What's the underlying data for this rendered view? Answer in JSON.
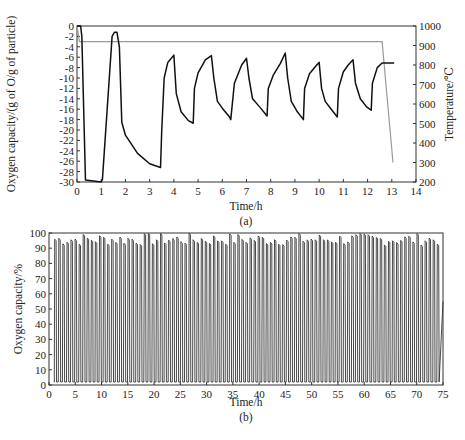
{
  "chart_data": [
    {
      "id": "a",
      "type": "line",
      "caption": "(a)",
      "xlabel": "Time/h",
      "ylabel": "Oxygen capacity/(g of O/g of particle)",
      "y2label": "Temperature/℃",
      "xlim": [
        0,
        14
      ],
      "ylim": [
        -30,
        0
      ],
      "y2lim": [
        200,
        1000
      ],
      "xticks": [
        0,
        1,
        2,
        3,
        4,
        5,
        6,
        7,
        8,
        9,
        10,
        11,
        12,
        13,
        14
      ],
      "yticks": [
        0,
        -2,
        -4,
        -6,
        -8,
        -10,
        -12,
        -14,
        -16,
        -18,
        -20,
        -22,
        -24,
        -26,
        -28,
        -30
      ],
      "y2ticks": [
        1000,
        900,
        800,
        700,
        600,
        500,
        400,
        300,
        200
      ],
      "series": [
        {
          "name": "Oxygen capacity",
          "axis": "left",
          "color": "#111111",
          "x": [
            0,
            0.15,
            0.2,
            0.35,
            1.0,
            1.05,
            1.45,
            1.55,
            1.65,
            1.75,
            1.85,
            2.0,
            2.5,
            3.0,
            3.45,
            3.5,
            3.6,
            3.75,
            4.0,
            4.1,
            4.3,
            4.6,
            4.8,
            4.85,
            5.0,
            5.3,
            5.55,
            5.65,
            5.8,
            6.0,
            6.3,
            6.35,
            6.5,
            6.8,
            7.0,
            7.1,
            7.25,
            7.55,
            7.85,
            7.9,
            8.1,
            8.4,
            8.6,
            8.7,
            8.85,
            9.1,
            9.35,
            9.4,
            9.6,
            9.9,
            10.0,
            10.1,
            10.25,
            10.5,
            10.75,
            10.8,
            11.0,
            11.2,
            11.4,
            11.5,
            11.7,
            11.95,
            12.15,
            12.2,
            12.4,
            12.6,
            12.8,
            13.1
          ],
          "y": [
            0,
            0,
            -2,
            -29.6,
            -30,
            -29.5,
            -2,
            -1.2,
            -1.2,
            -4,
            -18.5,
            -21,
            -24.5,
            -26.5,
            -27.2,
            -20,
            -10,
            -7,
            -5.6,
            -13,
            -16.5,
            -18.2,
            -18.7,
            -12,
            -9,
            -6.5,
            -5.7,
            -10,
            -14.5,
            -15.8,
            -17.5,
            -18,
            -11,
            -7.5,
            -6.2,
            -10,
            -14,
            -15.6,
            -17.3,
            -12,
            -9.5,
            -7.2,
            -5.2,
            -10,
            -14.5,
            -16.5,
            -18,
            -12,
            -9.2,
            -7.5,
            -7,
            -12,
            -14.5,
            -16,
            -17.5,
            -12,
            -8.8,
            -7.5,
            -6.5,
            -11,
            -14,
            -15.5,
            -16.2,
            -11,
            -8,
            -7.1,
            -7.1,
            -7.1
          ]
        },
        {
          "name": "Temperature",
          "axis": "right",
          "color": "#9a9a9a",
          "x": [
            0,
            0.1,
            0.2,
            12.6,
            13.05
          ],
          "y": [
            1000,
            920,
            920,
            920,
            300
          ]
        }
      ]
    },
    {
      "id": "b",
      "type": "line",
      "caption": "(b)",
      "xlabel": "Time/h",
      "ylabel": "Oxygen capacity/%",
      "xlim": [
        0,
        75
      ],
      "ylim": [
        0,
        100
      ],
      "xticks": [
        0,
        5,
        10,
        15,
        20,
        25,
        30,
        35,
        40,
        45,
        50,
        55,
        60,
        65,
        70,
        75
      ],
      "yticks": [
        0,
        10,
        20,
        30,
        40,
        50,
        60,
        70,
        80,
        90,
        100
      ],
      "description": "Repeated redox cycles oscillating between ~2% and ~97-100% over 75 h",
      "series": [
        {
          "name": "Oxygen capacity",
          "color": "#222222",
          "cycle_low": 2,
          "cycle_high_range": [
            92,
            100
          ],
          "approx_cycles": 95,
          "final_value": 55
        }
      ]
    }
  ]
}
